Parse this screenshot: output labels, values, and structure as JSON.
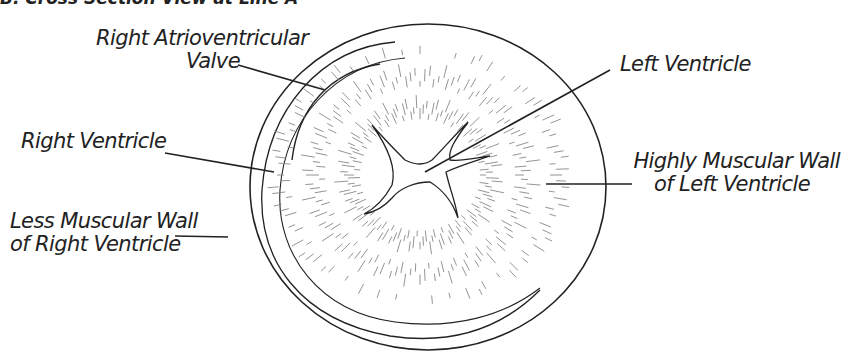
{
  "figure": {
    "title": "B. Cross Section View at Line A",
    "labels": {
      "right_av_valve": [
        "Right Atrioventricular",
        "Valve"
      ],
      "right_ventricle": [
        "Right Ventricle"
      ],
      "less_muscular_wall": [
        "Less Muscular Wall",
        "of Right Ventricle"
      ],
      "left_ventricle": [
        "Left Ventricle"
      ],
      "highly_muscular_wall": [
        "Highly Muscular Wall",
        "of Left Ventricle"
      ]
    },
    "line_color": "#222222"
  }
}
